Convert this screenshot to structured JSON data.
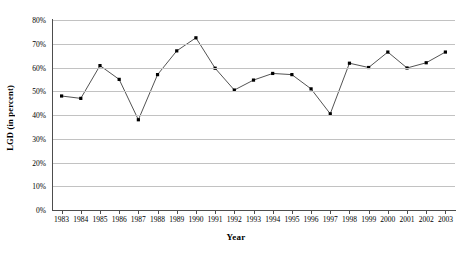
{
  "chart_data": {
    "type": "line",
    "title": "",
    "xlabel": "Year",
    "ylabel": "LGD (in percent)",
    "categories": [
      "1983",
      "1984",
      "1985",
      "1986",
      "1987",
      "1988",
      "1989",
      "1990",
      "1991",
      "1992",
      "1993",
      "1994",
      "1995",
      "1996",
      "1997",
      "1998",
      "1999",
      "2000",
      "2001",
      "2002",
      "2003"
    ],
    "values": [
      48.0,
      47.0,
      60.8,
      55.0,
      38.0,
      57.0,
      67.0,
      72.5,
      59.7,
      50.5,
      54.7,
      57.5,
      57.0,
      51.0,
      40.5,
      61.8,
      60.0,
      66.5,
      59.8,
      62.0,
      66.5
    ],
    "series": [
      {
        "name": "LGD",
        "values": [
          48.0,
          47.0,
          60.8,
          55.0,
          38.0,
          57.0,
          67.0,
          72.5,
          59.7,
          50.5,
          54.7,
          57.5,
          57.0,
          51.0,
          40.5,
          61.8,
          60.0,
          66.5,
          59.8,
          62.0,
          66.5
        ]
      }
    ],
    "ylim": [
      0,
      80
    ],
    "yticks": [
      0,
      10,
      20,
      30,
      40,
      50,
      60,
      70,
      80
    ],
    "ytick_labels": [
      "0%",
      "10%",
      "20%",
      "30%",
      "40%",
      "50%",
      "60%",
      "70%",
      "80%"
    ],
    "grid": true,
    "legend": "none",
    "marker": "square",
    "line_color": "#3f3f3f",
    "marker_color": "#000000",
    "grid_color": "#c2c2c2",
    "axis_color": "#4d4d4d",
    "background": "#ffffff"
  }
}
